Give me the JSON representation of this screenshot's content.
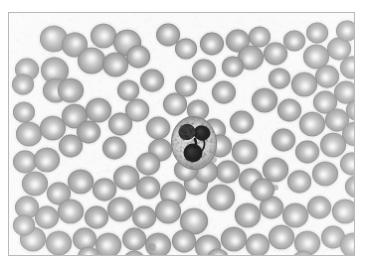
{
  "figure": {
    "kind": "light-microscopy-photomicrograph",
    "specimen": "peripheral blood smear",
    "rendering": "grayscale",
    "caption_partial": "",
    "frame": {
      "x": 8,
      "y": 12,
      "width": 347,
      "height": 244,
      "border_color": "#b9b9b9",
      "page_background": "#ffffff",
      "field_background": "#fafafa"
    },
    "palette": {
      "background": "#fafafa",
      "erythrocyte_rim": "#9a9a9a",
      "erythrocyte_mid": "#adadad",
      "erythrocyte_pallor": "#e8e8e8",
      "erythrocyte_edge": "#8a8a8a",
      "leukocyte_cytoplasm": "#cfcfcf",
      "leukocyte_cytoplasm_edge": "#9d9d9d",
      "leukocyte_nucleus": "#1c1c1c",
      "platelet": "#8e8e8e"
    },
    "leukocyte": {
      "label": "neutrophil",
      "description": "segmented neutrophil with dark multi-lobed nucleus and pale granular cytoplasm",
      "center_x": 186,
      "center_y": 131,
      "radius_x": 23,
      "radius_y": 27,
      "nuclear_lobes": 3
    },
    "counts": {
      "erythrocytes": 118,
      "leukocytes": 1,
      "platelets": 3
    },
    "erythrocytes": [
      {
        "x": 45,
        "y": 26,
        "r": 14,
        "p": 0.34,
        "px": -3,
        "py": -3,
        "rot": 8
      },
      {
        "x": 66,
        "y": 32,
        "r": 13,
        "p": 0.3,
        "px": 2,
        "py": -2,
        "rot": -10
      },
      {
        "x": 95,
        "y": 23,
        "r": 13,
        "p": 0.4,
        "px": 1,
        "py": 0,
        "rot": 0
      },
      {
        "x": 119,
        "y": 30,
        "r": 14,
        "p": 0.36,
        "px": -2,
        "py": -3,
        "rot": 14
      },
      {
        "x": 83,
        "y": 48,
        "r": 14,
        "p": 0.38,
        "px": 0,
        "py": -3,
        "rot": 0
      },
      {
        "x": 107,
        "y": 52,
        "r": 13,
        "p": 0.33,
        "px": 2,
        "py": 1,
        "rot": 0
      },
      {
        "x": 130,
        "y": 44,
        "r": 12,
        "p": 0.35,
        "px": -1,
        "py": -2,
        "rot": 0
      },
      {
        "x": 46,
        "y": 58,
        "r": 14,
        "p": 0.32,
        "px": -3,
        "py": 2,
        "rot": 20
      },
      {
        "x": 47,
        "y": 78,
        "r": 13,
        "p": 0.3,
        "px": 1,
        "py": 3,
        "rot": 0
      },
      {
        "x": 18,
        "y": 57,
        "r": 12,
        "p": 0.3,
        "px": -2,
        "py": 0,
        "rot": 0
      },
      {
        "x": 14,
        "y": 72,
        "r": 11,
        "p": 0.28,
        "px": 0,
        "py": 2,
        "rot": 0
      },
      {
        "x": 160,
        "y": 22,
        "r": 12,
        "p": 0.35,
        "px": 0,
        "py": -2,
        "rot": 0
      },
      {
        "x": 178,
        "y": 36,
        "r": 11,
        "p": 0.4,
        "px": 1,
        "py": 0,
        "rot": 0
      },
      {
        "x": 204,
        "y": 31,
        "r": 12,
        "p": 0.33,
        "px": -1,
        "py": 1,
        "rot": 0
      },
      {
        "x": 230,
        "y": 28,
        "r": 12,
        "p": 0.3,
        "px": 2,
        "py": -1,
        "rot": 0
      },
      {
        "x": 252,
        "y": 24,
        "r": 11,
        "p": 0.36,
        "px": 0,
        "py": 0,
        "rot": 0
      },
      {
        "x": 243,
        "y": 45,
        "r": 13,
        "p": 0.34,
        "px": -2,
        "py": 2,
        "rot": 0
      },
      {
        "x": 268,
        "y": 41,
        "r": 12,
        "p": 0.32,
        "px": 1,
        "py": -2,
        "rot": 0
      },
      {
        "x": 287,
        "y": 28,
        "r": 11,
        "p": 0.3,
        "px": 0,
        "py": 1,
        "rot": 0
      },
      {
        "x": 309,
        "y": 44,
        "r": 13,
        "p": 0.36,
        "px": -1,
        "py": 0,
        "rot": 0
      },
      {
        "x": 332,
        "y": 36,
        "r": 12,
        "p": 0.34,
        "px": 2,
        "py": 2,
        "rot": 0
      },
      {
        "x": 345,
        "y": 55,
        "r": 12,
        "p": 0.3,
        "px": 0,
        "py": -2,
        "rot": 0
      },
      {
        "x": 320,
        "y": 64,
        "r": 12,
        "p": 0.33,
        "px": -2,
        "py": 1,
        "rot": 0
      },
      {
        "x": 297,
        "y": 72,
        "r": 13,
        "p": 0.36,
        "px": 1,
        "py": 2,
        "rot": 0
      },
      {
        "x": 272,
        "y": 66,
        "r": 11,
        "p": 0.3,
        "px": 0,
        "py": 0,
        "rot": 0
      },
      {
        "x": 339,
        "y": 80,
        "r": 12,
        "p": 0.32,
        "px": 2,
        "py": 0,
        "rot": 0
      },
      {
        "x": 318,
        "y": 90,
        "r": 12,
        "p": 0.35,
        "px": -1,
        "py": 2,
        "rot": 0
      },
      {
        "x": 257,
        "y": 88,
        "r": 13,
        "p": 0.3,
        "px": 0,
        "py": 2,
        "rot": 0
      },
      {
        "x": 282,
        "y": 98,
        "r": 12,
        "p": 0.33,
        "px": 1,
        "py": -1,
        "rot": 0
      },
      {
        "x": 305,
        "y": 112,
        "r": 13,
        "p": 0.36,
        "px": -2,
        "py": 0,
        "rot": 0
      },
      {
        "x": 330,
        "y": 108,
        "r": 12,
        "p": 0.3,
        "px": 1,
        "py": 2,
        "rot": 0
      },
      {
        "x": 348,
        "y": 122,
        "r": 13,
        "p": 0.34,
        "px": 0,
        "py": 0,
        "rot": 0
      },
      {
        "x": 326,
        "y": 133,
        "r": 13,
        "p": 0.33,
        "px": -1,
        "py": 2,
        "rot": 0
      },
      {
        "x": 300,
        "y": 140,
        "r": 12,
        "p": 0.3,
        "px": 2,
        "py": 0,
        "rot": 0
      },
      {
        "x": 345,
        "y": 152,
        "r": 12,
        "p": 0.35,
        "px": 0,
        "py": 1,
        "rot": 0
      },
      {
        "x": 318,
        "y": 162,
        "r": 13,
        "p": 0.32,
        "px": -2,
        "py": 1,
        "rot": 0
      },
      {
        "x": 292,
        "y": 170,
        "r": 12,
        "p": 0.36,
        "px": 1,
        "py": 0,
        "rot": 0
      },
      {
        "x": 268,
        "y": 158,
        "r": 13,
        "p": 0.3,
        "px": 0,
        "py": 2,
        "rot": 0
      },
      {
        "x": 243,
        "y": 168,
        "r": 12,
        "p": 0.33,
        "px": 2,
        "py": -1,
        "rot": 0
      },
      {
        "x": 220,
        "y": 160,
        "r": 12,
        "p": 0.3,
        "px": -1,
        "py": 1,
        "rot": 0
      },
      {
        "x": 237,
        "y": 140,
        "r": 13,
        "p": 0.34,
        "px": 0,
        "py": 0,
        "rot": 0
      },
      {
        "x": 213,
        "y": 186,
        "r": 14,
        "p": 0.32,
        "px": 1,
        "py": 2,
        "rot": 0
      },
      {
        "x": 188,
        "y": 172,
        "r": 12,
        "p": 0.3,
        "px": -2,
        "py": 0,
        "rot": 0
      },
      {
        "x": 165,
        "y": 182,
        "r": 13,
        "p": 0.35,
        "px": 0,
        "py": 2,
        "rot": 0
      },
      {
        "x": 140,
        "y": 176,
        "r": 12,
        "p": 0.3,
        "px": 2,
        "py": 0,
        "rot": 0
      },
      {
        "x": 118,
        "y": 166,
        "r": 13,
        "p": 0.33,
        "px": -1,
        "py": 1,
        "rot": 0
      },
      {
        "x": 96,
        "y": 178,
        "r": 12,
        "p": 0.36,
        "px": 0,
        "py": 0,
        "rot": 0
      },
      {
        "x": 72,
        "y": 170,
        "r": 13,
        "p": 0.3,
        "px": 1,
        "py": 2,
        "rot": 0
      },
      {
        "x": 50,
        "y": 182,
        "r": 12,
        "p": 0.32,
        "px": -2,
        "py": 0,
        "rot": 0
      },
      {
        "x": 26,
        "y": 172,
        "r": 13,
        "p": 0.34,
        "px": 0,
        "py": 1,
        "rot": 0
      },
      {
        "x": 16,
        "y": 150,
        "r": 12,
        "p": 0.3,
        "px": 2,
        "py": 0,
        "rot": 0
      },
      {
        "x": 38,
        "y": 148,
        "r": 13,
        "p": 0.35,
        "px": -1,
        "py": 2,
        "rot": 0
      },
      {
        "x": 20,
        "y": 122,
        "r": 13,
        "p": 0.32,
        "px": 0,
        "py": 0,
        "rot": 0
      },
      {
        "x": 44,
        "y": 116,
        "r": 13,
        "p": 0.36,
        "px": 1,
        "py": 1,
        "rot": 0
      },
      {
        "x": 66,
        "y": 104,
        "r": 13,
        "p": 0.3,
        "px": -2,
        "py": 2,
        "rot": 0
      },
      {
        "x": 90,
        "y": 98,
        "r": 13,
        "p": 0.33,
        "px": 0,
        "py": 0,
        "rot": 0
      },
      {
        "x": 80,
        "y": 120,
        "r": 12,
        "p": 0.3,
        "px": 2,
        "py": 1,
        "rot": 0
      },
      {
        "x": 112,
        "y": 112,
        "r": 12,
        "p": 0.35,
        "px": -1,
        "py": 0,
        "rot": 0
      },
      {
        "x": 129,
        "y": 98,
        "r": 12,
        "p": 0.4,
        "px": 0,
        "py": 0,
        "rot": 0
      },
      {
        "x": 150,
        "y": 116,
        "r": 12,
        "p": 0.34,
        "px": 1,
        "py": 2,
        "rot": 0
      },
      {
        "x": 152,
        "y": 138,
        "r": 12,
        "p": 0.3,
        "px": -1,
        "py": 0,
        "rot": 0
      },
      {
        "x": 140,
        "y": 152,
        "r": 12,
        "p": 0.33,
        "px": 0,
        "py": 1,
        "rot": 0
      },
      {
        "x": 167,
        "y": 92,
        "r": 12,
        "p": 0.38,
        "px": 1,
        "py": -1,
        "rot": 0
      },
      {
        "x": 190,
        "y": 98,
        "r": 11,
        "p": 0.3,
        "px": 0,
        "py": 0,
        "rot": 0
      },
      {
        "x": 206,
        "y": 118,
        "r": 12,
        "p": 0.3,
        "px": 2,
        "py": 1,
        "rot": 0
      },
      {
        "x": 198,
        "y": 160,
        "r": 12,
        "p": 0.32,
        "px": -1,
        "py": 0,
        "rot": 0
      },
      {
        "x": 178,
        "y": 158,
        "r": 12,
        "p": 0.3,
        "px": 0,
        "py": 2,
        "rot": 0
      },
      {
        "x": 160,
        "y": 200,
        "r": 13,
        "p": 0.36,
        "px": 1,
        "py": 0,
        "rot": 0
      },
      {
        "x": 186,
        "y": 210,
        "r": 14,
        "p": 0.4,
        "px": 0,
        "py": -2,
        "rot": 0
      },
      {
        "x": 136,
        "y": 206,
        "r": 12,
        "p": 0.3,
        "px": -2,
        "py": 1,
        "rot": 0
      },
      {
        "x": 112,
        "y": 198,
        "r": 13,
        "p": 0.33,
        "px": 0,
        "py": 0,
        "rot": 0
      },
      {
        "x": 88,
        "y": 206,
        "r": 12,
        "p": 0.3,
        "px": 2,
        "py": 2,
        "rot": 0
      },
      {
        "x": 62,
        "y": 200,
        "r": 13,
        "p": 0.35,
        "px": -1,
        "py": 0,
        "rot": 0
      },
      {
        "x": 38,
        "y": 206,
        "r": 12,
        "p": 0.32,
        "px": 0,
        "py": 1,
        "rot": 0
      },
      {
        "x": 18,
        "y": 196,
        "r": 12,
        "p": 0.3,
        "px": 1,
        "py": 0,
        "rot": 0
      },
      {
        "x": 24,
        "y": 228,
        "r": 13,
        "p": 0.36,
        "px": -1,
        "py": 2,
        "rot": 0
      },
      {
        "x": 50,
        "y": 232,
        "r": 13,
        "p": 0.33,
        "px": 0,
        "py": 0,
        "rot": 0
      },
      {
        "x": 76,
        "y": 228,
        "r": 12,
        "p": 0.3,
        "px": 2,
        "py": 1,
        "rot": 0
      },
      {
        "x": 100,
        "y": 234,
        "r": 13,
        "p": 0.35,
        "px": -2,
        "py": 0,
        "rot": 0
      },
      {
        "x": 126,
        "y": 228,
        "r": 12,
        "p": 0.32,
        "px": 0,
        "py": 2,
        "rot": 0
      },
      {
        "x": 150,
        "y": 234,
        "r": 13,
        "p": 0.3,
        "px": 1,
        "py": 0,
        "rot": 0
      },
      {
        "x": 176,
        "y": 230,
        "r": 12,
        "p": 0.36,
        "px": -1,
        "py": 1,
        "rot": 0
      },
      {
        "x": 200,
        "y": 236,
        "r": 13,
        "p": 0.33,
        "px": 0,
        "py": 0,
        "rot": 0
      },
      {
        "x": 226,
        "y": 228,
        "r": 13,
        "p": 0.3,
        "px": 2,
        "py": 2,
        "rot": 0
      },
      {
        "x": 250,
        "y": 234,
        "r": 12,
        "p": 0.35,
        "px": -2,
        "py": 0,
        "rot": 0
      },
      {
        "x": 274,
        "y": 226,
        "r": 13,
        "p": 0.32,
        "px": 0,
        "py": 1,
        "rot": 0
      },
      {
        "x": 300,
        "y": 232,
        "r": 13,
        "p": 0.36,
        "px": 1,
        "py": 0,
        "rot": 0
      },
      {
        "x": 326,
        "y": 226,
        "r": 12,
        "p": 0.3,
        "px": -1,
        "py": 2,
        "rot": 0
      },
      {
        "x": 346,
        "y": 234,
        "r": 13,
        "p": 0.33,
        "px": 0,
        "py": 0,
        "rot": 0
      },
      {
        "x": 240,
        "y": 204,
        "r": 13,
        "p": 0.3,
        "px": 2,
        "py": 1,
        "rot": 0
      },
      {
        "x": 264,
        "y": 196,
        "r": 12,
        "p": 0.35,
        "px": -1,
        "py": 0,
        "rot": 0
      },
      {
        "x": 288,
        "y": 204,
        "r": 13,
        "p": 0.32,
        "px": 0,
        "py": 2,
        "rot": 0
      },
      {
        "x": 312,
        "y": 196,
        "r": 12,
        "p": 0.3,
        "px": 1,
        "py": 0,
        "rot": 0
      },
      {
        "x": 338,
        "y": 200,
        "r": 13,
        "p": 0.36,
        "px": -2,
        "py": 1,
        "rot": 0
      },
      {
        "x": 216,
        "y": 80,
        "r": 12,
        "p": 0.33,
        "px": 0,
        "py": 0,
        "rot": 0
      },
      {
        "x": 234,
        "y": 110,
        "r": 12,
        "p": 0.3,
        "px": 2,
        "py": 2,
        "rot": 0
      },
      {
        "x": 212,
        "y": 134,
        "r": 12,
        "p": 0.32,
        "px": -1,
        "py": 0,
        "rot": 0
      },
      {
        "x": 144,
        "y": 68,
        "r": 12,
        "p": 0.3,
        "px": 0,
        "py": 1,
        "rot": 0
      },
      {
        "x": 120,
        "y": 78,
        "r": 11,
        "p": 0.35,
        "px": 1,
        "py": 0,
        "rot": 0
      },
      {
        "x": 62,
        "y": 78,
        "r": 13,
        "p": 0.3,
        "px": -2,
        "py": 2,
        "rot": 0
      },
      {
        "x": 196,
        "y": 58,
        "r": 12,
        "p": 0.36,
        "px": 0,
        "py": 0,
        "rot": 0
      },
      {
        "x": 178,
        "y": 74,
        "r": 11,
        "p": 0.3,
        "px": 2,
        "py": 1,
        "rot": 0
      },
      {
        "x": 340,
        "y": 18,
        "r": 11,
        "p": 0.32,
        "px": 0,
        "py": 0,
        "rot": 0
      },
      {
        "x": 310,
        "y": 20,
        "r": 11,
        "p": 0.3,
        "px": -1,
        "py": 1,
        "rot": 0
      },
      {
        "x": 15,
        "y": 100,
        "r": 11,
        "p": 0.3,
        "px": 1,
        "py": 0,
        "rot": 0
      },
      {
        "x": 15,
        "y": 214,
        "r": 11,
        "p": 0.33,
        "px": 0,
        "py": 2,
        "rot": 0
      },
      {
        "x": 350,
        "y": 175,
        "r": 12,
        "p": 0.3,
        "px": -1,
        "py": 0,
        "rot": 0
      },
      {
        "x": 350,
        "y": 98,
        "r": 11,
        "p": 0.32,
        "px": 0,
        "py": 0,
        "rot": 0
      },
      {
        "x": 225,
        "y": 54,
        "r": 11,
        "p": 0.3,
        "px": 1,
        "py": 1,
        "rot": 0
      },
      {
        "x": 106,
        "y": 136,
        "r": 12,
        "p": 0.3,
        "px": -1,
        "py": 0,
        "rot": 0
      },
      {
        "x": 62,
        "y": 134,
        "r": 12,
        "p": 0.32,
        "px": 0,
        "py": 2,
        "rot": 0
      },
      {
        "x": 276,
        "y": 128,
        "r": 12,
        "p": 0.3,
        "px": 2,
        "py": 0,
        "rot": 0
      },
      {
        "x": 255,
        "y": 178,
        "r": 12,
        "p": 0.33,
        "px": 0,
        "py": 1,
        "rot": 0
      },
      {
        "x": 80,
        "y": 246,
        "r": 11,
        "p": 0.3,
        "px": 0,
        "py": -2,
        "rot": 0
      },
      {
        "x": 210,
        "y": 248,
        "r": 11,
        "p": 0.32,
        "px": 1,
        "py": -2,
        "rot": 0
      },
      {
        "x": 296,
        "y": 250,
        "r": 11,
        "p": 0.3,
        "px": 0,
        "py": -2,
        "rot": 0
      },
      {
        "x": 126,
        "y": 250,
        "r": 11,
        "p": 0.3,
        "px": -1,
        "py": -2,
        "rot": 0
      }
    ],
    "platelets": [
      {
        "x": 144,
        "y": 236,
        "r": 4
      },
      {
        "x": 268,
        "y": 176,
        "r": 3
      },
      {
        "x": 206,
        "y": 148,
        "r": 3
      }
    ]
  }
}
